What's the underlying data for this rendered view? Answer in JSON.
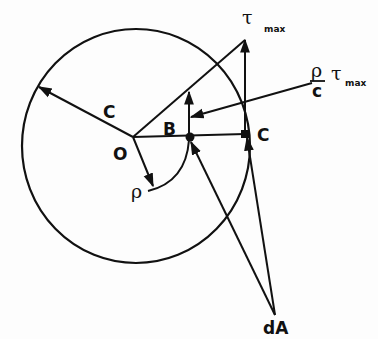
{
  "diagram": {
    "labels": {
      "radius_label": "C",
      "center_label": "O",
      "point_b_label": "B",
      "point_c_label": "C",
      "rho_label": "ρ",
      "tau_symbol": "τ",
      "tau_max_sub": "max",
      "fraction_numerator": "ρ",
      "fraction_denominator": "c",
      "stress_tau_symbol": "τ",
      "stress_max_sub": "max",
      "area_label": "dA"
    },
    "colors": {
      "stroke": "#111111",
      "background": "#fdfdfd"
    }
  }
}
